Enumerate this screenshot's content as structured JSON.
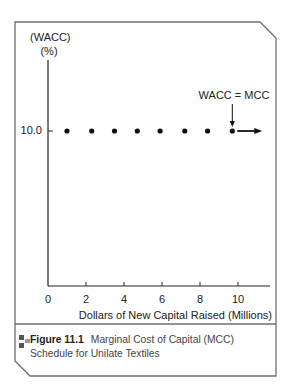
{
  "chart_data": {
    "type": "scatter",
    "xlabel": "Dollars of New Capital Raised (Millions)",
    "ylabel": "(WACC) (%)",
    "x_ticks": [
      0,
      2,
      4,
      6,
      8,
      10
    ],
    "y_ticks": [
      10.0
    ],
    "xlim": [
      0,
      11.5
    ],
    "series": [
      {
        "name": "WACC = MCC",
        "x": [
          1.0,
          2.3,
          3.5,
          4.7,
          5.9,
          7.2,
          8.4,
          9.7
        ],
        "y": [
          10.0,
          10.0,
          10.0,
          10.0,
          10.0,
          10.0,
          10.0,
          10.0
        ],
        "continues_right": true
      }
    ],
    "annotations": [
      {
        "text": "WACC = MCC",
        "points_to_x": 9.7,
        "y": 10.0
      }
    ],
    "grid": false,
    "legend": "none"
  },
  "figure": {
    "ylabel_line1": "(WACC)",
    "ylabel_line2": "(%)",
    "ytick_label": "10.0",
    "xtick_labels": [
      "0",
      "2",
      "4",
      "6",
      "8",
      "10"
    ],
    "xlabel": "Dollars of New Capital Raised (Millions)",
    "annotation": "WACC = MCC",
    "caption_number": "Figure 11.1",
    "caption_text": "Marginal Cost of Capital (MCC) Schedule for Unilate Textiles"
  },
  "colors": {
    "frame": "#6e6e6e",
    "axis": "#222222",
    "points": "#111111",
    "icon_dark": "#555555",
    "icon_light": "#999999"
  }
}
